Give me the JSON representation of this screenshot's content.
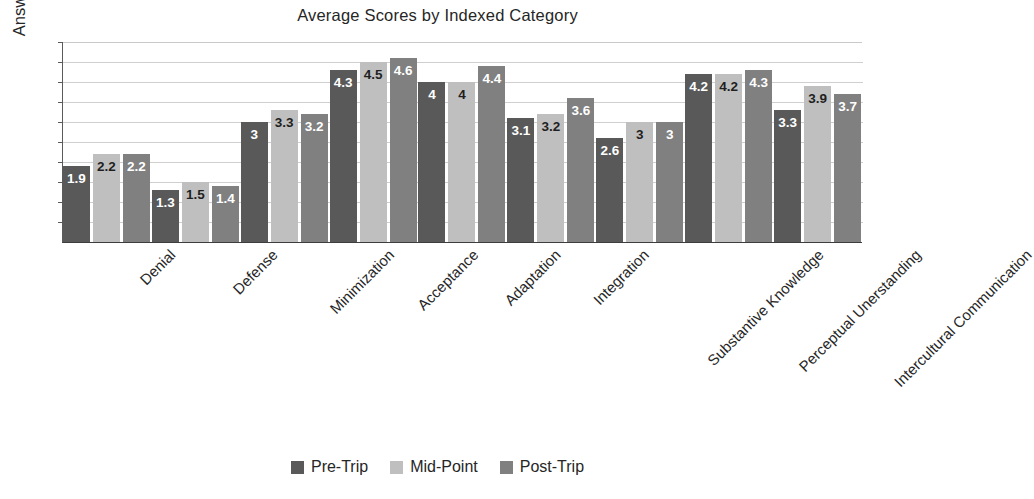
{
  "chart_data": {
    "type": "bar",
    "title": "Average Scores by Indexed Category",
    "xlabel": "",
    "ylabel": "Answer Scale (1-5)",
    "ylim": [
      0,
      5
    ],
    "grid": true,
    "y_tick_labels_visible": false,
    "legend_position": "bottom",
    "categories": [
      "Denial",
      "Defense",
      "Minimization",
      "Acceptance",
      "Adaptation",
      "Integration",
      "Substantive Knowledge",
      "Perceptual Unerstanding",
      "Intercultural Communication"
    ],
    "series": [
      {
        "name": "Pre-Trip",
        "color": "#595959",
        "values": [
          1.9,
          1.3,
          3,
          4.3,
          4,
          3.1,
          2.6,
          4.2,
          3.3
        ],
        "labels": [
          "1.9",
          "1.3",
          "3",
          "4.3",
          "4",
          "3.1",
          "2.6",
          "4.2",
          "3.3"
        ]
      },
      {
        "name": "Mid-Point",
        "color": "#bfbfbf",
        "values": [
          2.2,
          1.5,
          3.3,
          4.5,
          4,
          3.2,
          3,
          4.2,
          3.9
        ],
        "labels": [
          "2.2",
          "1.5",
          "3.3",
          "4.5",
          "4",
          "3.2",
          "3",
          "4.2",
          "3.9"
        ]
      },
      {
        "name": "Post-Trip",
        "color": "#808080",
        "values": [
          2.2,
          1.4,
          3.2,
          4.6,
          4.4,
          3.6,
          3,
          4.3,
          3.7
        ],
        "labels": [
          "2.2",
          "1.4",
          "3.2",
          "4.6",
          "4.4",
          "3.6",
          "3",
          "4.3",
          "3.7"
        ]
      }
    ]
  }
}
